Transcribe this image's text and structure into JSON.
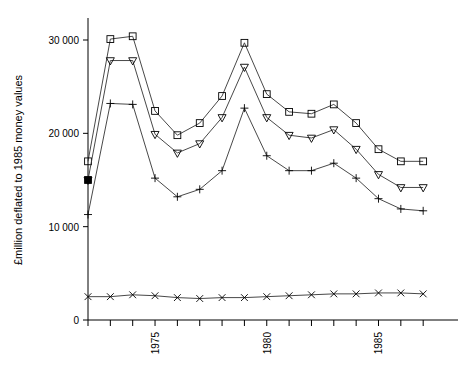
{
  "chart_data": {
    "type": "line",
    "title": "",
    "subtitle": "",
    "xlabel": "",
    "ylabel": "£million deflated to 1985 money values",
    "x": [
      1972,
      1973,
      1974,
      1975,
      1976,
      1977,
      1978,
      1979,
      1980,
      1981,
      1982,
      1983,
      1984,
      1985,
      1986,
      1987
    ],
    "xlim": [
      1972,
      1987
    ],
    "ylim": [
      0,
      32000
    ],
    "xticks": [
      1972,
      1973,
      1974,
      1975,
      1976,
      1977,
      1978,
      1979,
      1980,
      1981,
      1982,
      1983,
      1984,
      1985,
      1986,
      1987
    ],
    "xtick_labels": [
      "",
      "",
      "",
      "1975",
      "",
      "",
      "",
      "",
      "1980",
      "",
      "",
      "",
      "",
      "1985",
      "",
      ""
    ],
    "yticks": [
      0,
      10000,
      20000,
      30000
    ],
    "ytick_labels": [
      "0",
      "10 000",
      "20 000",
      "30 000"
    ],
    "grid": false,
    "legend": "none",
    "series": [
      {
        "name": "series-square",
        "marker": "square",
        "color": "#333333",
        "values": [
          17000,
          30100,
          30400,
          22400,
          19800,
          21100,
          24000,
          29700,
          24200,
          22300,
          22100,
          23100,
          21100,
          18300,
          17000,
          17000
        ]
      },
      {
        "name": "series-triangle-down",
        "marker": "triangle-down",
        "color": "#333333",
        "values": [
          15000,
          27800,
          27800,
          19900,
          17900,
          18900,
          21700,
          27100,
          21700,
          19800,
          19500,
          20400,
          18300,
          15600,
          14200,
          14200
        ]
      },
      {
        "name": "series-plus",
        "marker": "plus",
        "color": "#333333",
        "values": [
          11300,
          23200,
          23100,
          15200,
          13200,
          14000,
          16000,
          22700,
          17600,
          16000,
          16000,
          16800,
          15200,
          13000,
          11900,
          11700
        ]
      },
      {
        "name": "series-cross",
        "marker": "cross",
        "color": "#333333",
        "values": [
          2500,
          2500,
          2700,
          2600,
          2400,
          2300,
          2400,
          2400,
          2500,
          2600,
          2700,
          2800,
          2800,
          2900,
          2900,
          2800
        ]
      }
    ],
    "highlight_point": {
      "name": "filled-square-marker",
      "x": 1972,
      "y": 15000,
      "marker": "filled-square"
    }
  },
  "axes": {
    "y_axis_title": "£million deflated to 1985 money values"
  }
}
